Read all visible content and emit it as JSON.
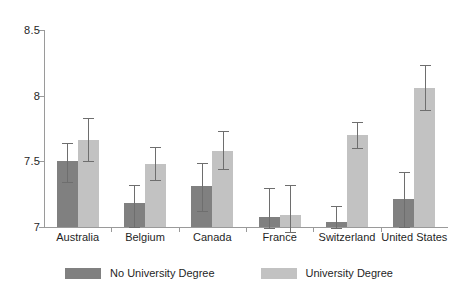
{
  "chart_data": {
    "type": "bar",
    "title": "",
    "subtitle": "",
    "xlabel": "",
    "ylabel": "",
    "categories": [
      "Australia",
      "Belgium",
      "Canada",
      "France",
      "Switzerland",
      "United States"
    ],
    "ylim": [
      7,
      8.5
    ],
    "yticks": [
      7,
      7.5,
      8,
      8.5
    ],
    "ytick_labels": [
      "7",
      "7.5",
      "8",
      "8.5"
    ],
    "grid": false,
    "legend_position": "bottom",
    "orientation": "vertical",
    "error_bars": "symmetric",
    "series": [
      {
        "name": "No University Degree",
        "color": "#808080",
        "values": [
          7.5,
          7.18,
          7.31,
          7.08,
          7.04,
          7.21
        ],
        "err_low": [
          7.34,
          7.0,
          7.12,
          6.99,
          6.99,
          7.0
        ],
        "err_high": [
          7.64,
          7.32,
          7.49,
          7.3,
          7.16,
          7.42
        ]
      },
      {
        "name": "University Degree",
        "color": "#c2c2c2",
        "values": [
          7.66,
          7.48,
          7.58,
          7.09,
          7.7,
          8.06
        ],
        "err_low": [
          7.5,
          7.36,
          7.44,
          6.96,
          7.6,
          7.89
        ],
        "err_high": [
          7.83,
          7.61,
          7.73,
          7.32,
          7.8,
          8.23
        ]
      }
    ]
  },
  "legend": {
    "items": [
      {
        "label": "No University Degree",
        "color": "#808080"
      },
      {
        "label": "University Degree",
        "color": "#c2c2c2"
      }
    ]
  },
  "artifacts": [
    {
      "text": "",
      "left": 118,
      "top": 12
    },
    {
      "text": "",
      "left": 272,
      "top": 12
    },
    {
      "text": "",
      "left": 268,
      "top": 68
    }
  ]
}
